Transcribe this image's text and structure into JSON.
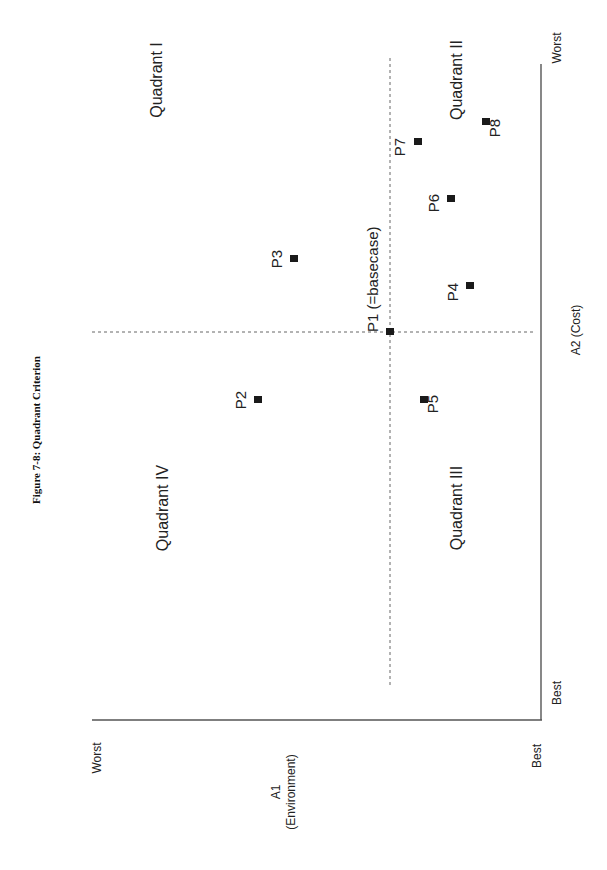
{
  "chart_data": {
    "type": "scatter",
    "title": "Figure 7-8: Quadrant Criterion",
    "orientation_note": "page rotated 90 degrees counter-clockwise",
    "x_axis": {
      "label": "A1 (Environment)",
      "label_line1": "A1",
      "label_line2": "(Environment)",
      "min_label": "Worst",
      "max_label": "Best"
    },
    "y_axis": {
      "label": "A2 (Cost)",
      "min_label": "Best",
      "max_label": "Worst"
    },
    "basecase": {
      "name": "P1",
      "label": "P1 (=basecase)"
    },
    "quadrants": [
      {
        "name": "Quadrant I",
        "sx": 162,
        "sy": 80
      },
      {
        "name": "Quadrant II",
        "sx": 462,
        "sy": 80
      },
      {
        "name": "Quadrant III",
        "sx": 462,
        "sy": 508
      },
      {
        "name": "Quadrant IV",
        "sx": 168,
        "sy": 508
      }
    ],
    "points": [
      {
        "name": "P1",
        "label": "P1 (=basecase)",
        "sx": 390,
        "sy": 332,
        "lx": 378,
        "ly": 332,
        "anchor": "start"
      },
      {
        "name": "P2",
        "label": "P2",
        "sx": 258,
        "sy": 400,
        "lx": 246,
        "ly": 400,
        "anchor": "middle"
      },
      {
        "name": "P3",
        "label": "P3",
        "sx": 294,
        "sy": 259,
        "lx": 282,
        "ly": 259,
        "anchor": "middle"
      },
      {
        "name": "P4",
        "label": "P4",
        "sx": 470,
        "sy": 286,
        "lx": 458,
        "ly": 292,
        "anchor": "middle"
      },
      {
        "name": "P5",
        "label": "P5",
        "sx": 424,
        "sy": 400,
        "lx": 438,
        "ly": 404,
        "anchor": "middle"
      },
      {
        "name": "P6",
        "label": "P6",
        "sx": 451,
        "sy": 199,
        "lx": 439,
        "ly": 203,
        "anchor": "middle"
      },
      {
        "name": "P7",
        "label": "P7",
        "sx": 418,
        "sy": 142,
        "lx": 405,
        "ly": 147,
        "anchor": "middle"
      },
      {
        "name": "P8",
        "label": "P8",
        "sx": 486,
        "sy": 122,
        "lx": 500,
        "ly": 128,
        "anchor": "middle"
      }
    ],
    "relative_positions": [
      {
        "name": "P1",
        "A1": 0.0,
        "A2": 0.0
      },
      {
        "name": "P2",
        "A1": -0.8,
        "A2": -0.25
      },
      {
        "name": "P3",
        "A1": -0.6,
        "A2": 0.25
      },
      {
        "name": "P4",
        "A1": 0.55,
        "A2": 0.2
      },
      {
        "name": "P5",
        "A1": 0.25,
        "A2": -0.25
      },
      {
        "name": "P6",
        "A1": 0.45,
        "A2": 0.5
      },
      {
        "name": "P7",
        "A1": 0.2,
        "A2": 0.7
      },
      {
        "name": "P8",
        "A1": 0.65,
        "A2": 0.8
      }
    ],
    "grid": false,
    "legend": null
  }
}
